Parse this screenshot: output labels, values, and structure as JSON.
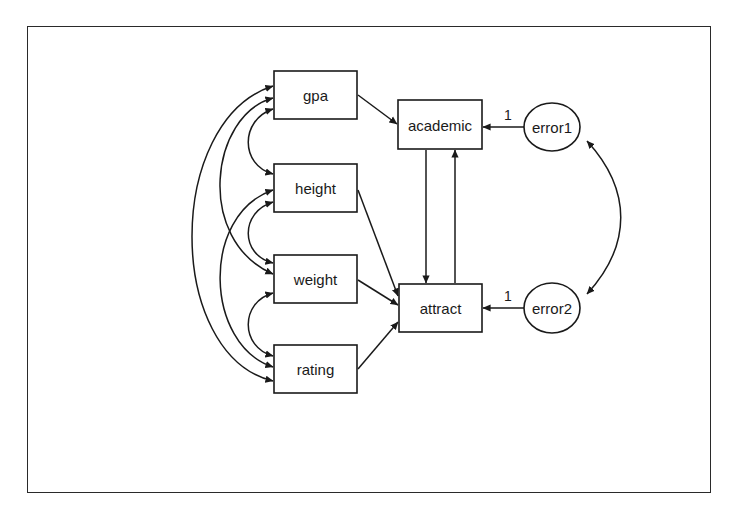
{
  "diagram": {
    "type": "path-diagram",
    "observed_exogenous": [
      {
        "id": "gpa",
        "label": "gpa"
      },
      {
        "id": "height",
        "label": "height"
      },
      {
        "id": "weight",
        "label": "weight"
      },
      {
        "id": "rating",
        "label": "rating"
      }
    ],
    "observed_endogenous": [
      {
        "id": "academic",
        "label": "academic"
      },
      {
        "id": "attract",
        "label": "attract"
      }
    ],
    "latent_errors": [
      {
        "id": "error1",
        "label": "error1"
      },
      {
        "id": "error2",
        "label": "error2"
      }
    ],
    "paths": [
      {
        "from": "gpa",
        "to": "academic"
      },
      {
        "from": "height",
        "to": "attract"
      },
      {
        "from": "weight",
        "to": "attract"
      },
      {
        "from": "rating",
        "to": "attract"
      },
      {
        "from": "academic",
        "to": "attract"
      },
      {
        "from": "attract",
        "to": "academic"
      },
      {
        "from": "error1",
        "to": "academic",
        "coefficient": "1"
      },
      {
        "from": "error2",
        "to": "attract",
        "coefficient": "1"
      }
    ],
    "covariances": [
      [
        "gpa",
        "height"
      ],
      [
        "gpa",
        "weight"
      ],
      [
        "gpa",
        "rating"
      ],
      [
        "height",
        "weight"
      ],
      [
        "height",
        "rating"
      ],
      [
        "weight",
        "rating"
      ],
      [
        "error1",
        "error2"
      ]
    ],
    "coefficients": {
      "error1_academic": "1",
      "error2_attract": "1"
    },
    "colors": {
      "stroke": "#1a1a1a",
      "background": "#ffffff"
    }
  }
}
